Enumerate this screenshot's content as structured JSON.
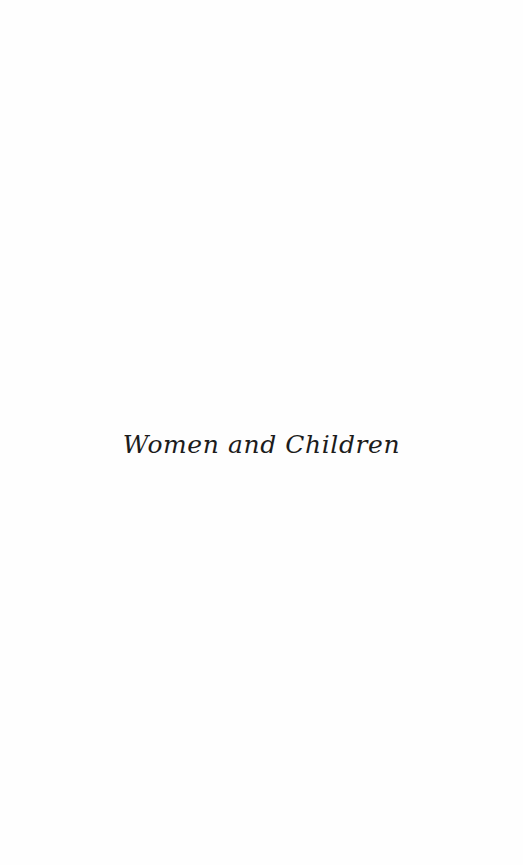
{
  "page": {
    "type": "half-title",
    "background": "#fefefe",
    "text_color": "#1c1c1c"
  },
  "half_title": {
    "text": "Women and Children"
  }
}
